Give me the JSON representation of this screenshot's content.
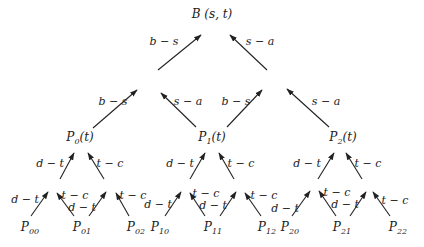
{
  "diagram": {
    "title": "B (s, t)",
    "top_level": {
      "left_label": "b − s",
      "right_label": "s − a"
    },
    "middle_nodes": [
      {
        "base": "P",
        "sub": "0",
        "suffix": "(t)"
      },
      {
        "base": "P",
        "sub": "1",
        "suffix": "(t)"
      },
      {
        "base": "P",
        "sub": "2",
        "suffix": "(t)"
      }
    ],
    "middle_edge_labels": {
      "left": "b − s",
      "right": "s − a"
    },
    "lower_edge_labels": {
      "left": "d − t",
      "right": "t − c"
    },
    "leaf_nodes": [
      {
        "base": "P",
        "sub": "00"
      },
      {
        "base": "P",
        "sub": "01"
      },
      {
        "base": "P",
        "sub": "02"
      },
      {
        "base": "P",
        "sub": "10"
      },
      {
        "base": "P",
        "sub": "11"
      },
      {
        "base": "P",
        "sub": "12"
      },
      {
        "base": "P",
        "sub": "20"
      },
      {
        "base": "P",
        "sub": "21"
      },
      {
        "base": "P",
        "sub": "22"
      }
    ]
  }
}
